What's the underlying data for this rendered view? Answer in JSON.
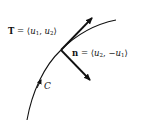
{
  "diagram": {
    "title": "",
    "labels": {
      "tangent": {
        "symbol": "T",
        "equals": " = ⟨",
        "comp1_var": "u",
        "comp1_sub": "1",
        "sep": ", ",
        "comp2_var": "u",
        "comp2_sub": "2",
        "close": "⟩"
      },
      "normal": {
        "symbol": "n",
        "equals": " = ⟨",
        "comp1_var": "u",
        "comp1_sub": "2",
        "sep": ", −",
        "comp2_var": "u",
        "comp2_sub": "1",
        "close": "⟩"
      },
      "curve": "C"
    },
    "colors": {
      "stroke": "#111111",
      "background": "#ffffff"
    }
  }
}
